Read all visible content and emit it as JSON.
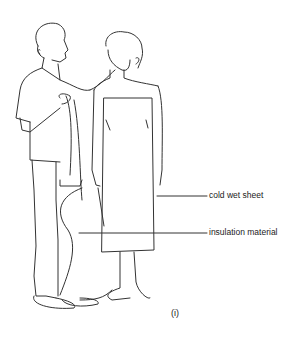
{
  "diagram": {
    "labels": {
      "sheet": "cold wet sheet",
      "insulation": "insulation material"
    },
    "figure_number": "(i)"
  }
}
